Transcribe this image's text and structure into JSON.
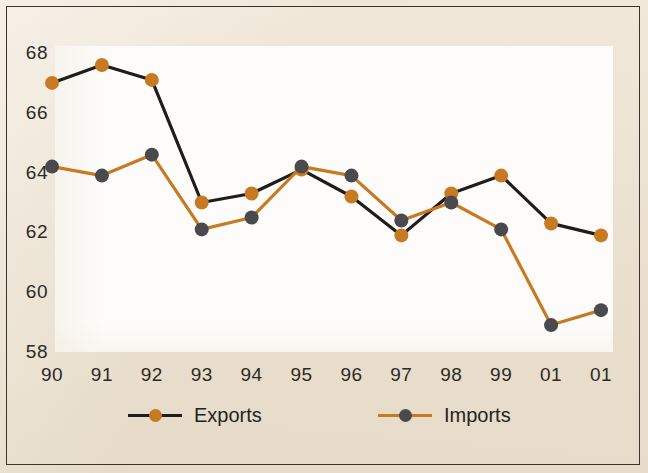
{
  "chart_data": {
    "type": "line",
    "title": "Exports and Imports",
    "xlabel": "",
    "ylabel": "",
    "categories": [
      "90",
      "91",
      "92",
      "93",
      "94",
      "95",
      "96",
      "97",
      "98",
      "99",
      "01",
      "01"
    ],
    "ylim": [
      58,
      68
    ],
    "yticks": [
      58,
      60,
      62,
      64,
      66,
      68
    ],
    "grid": false,
    "legend_position": "bottom",
    "series": [
      {
        "name": "Exports",
        "line_color": "#1f1d1a",
        "marker_color": "#c87a23",
        "values": [
          67.0,
          67.6,
          67.1,
          63.0,
          63.3,
          64.1,
          63.2,
          61.9,
          63.3,
          63.9,
          62.3,
          61.9
        ]
      },
      {
        "name": "Imports",
        "line_color": "#c87a23",
        "marker_color": "#4a4a4e",
        "values": [
          64.2,
          63.9,
          64.6,
          62.1,
          62.5,
          64.2,
          63.9,
          62.4,
          63.0,
          62.1,
          58.9,
          59.4
        ]
      }
    ]
  },
  "colors": {
    "background": "#ece2d2",
    "plot_background": "#fdfcfa",
    "frame": "#3a342c",
    "orange": "#c87a23",
    "dark": "#1f1d1a",
    "gray_marker": "#4a4a4e",
    "text": "#2c2a26"
  }
}
